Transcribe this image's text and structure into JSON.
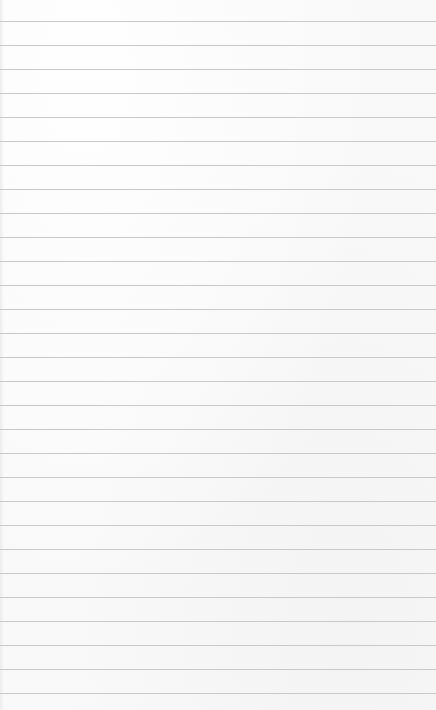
{
  "sheet": {
    "type": "lined-paper",
    "background_color": "#f9f9f9",
    "line_color": "#c9c9c9",
    "first_line_y": 21,
    "line_spacing": 24,
    "line_count": 29,
    "text": ""
  }
}
